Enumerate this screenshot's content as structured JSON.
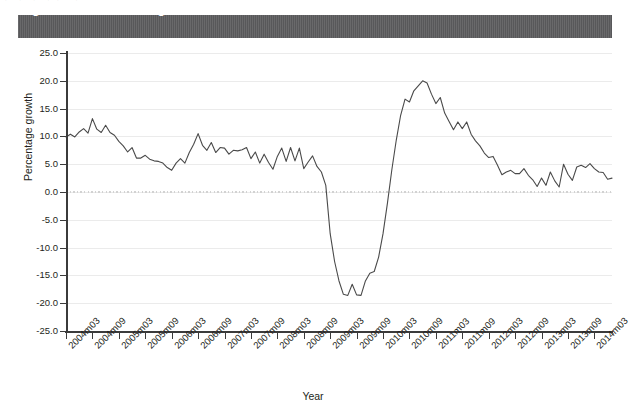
{
  "page_top_fragment": ". ,  .  .     ,    .       .  ,   .    .   ,  .   ,  .  .  .   ,   .",
  "figure": {
    "title": "Figure 2.13: World trade growth"
  },
  "chart_data": {
    "type": "line",
    "title": "Figure 2.13: World trade growth",
    "xlabel": "Year",
    "ylabel": "Percentage growth",
    "ylim": [
      -25.0,
      25.0
    ],
    "y_ticks": [
      "25.0",
      "20.0",
      "15.0",
      "10.0",
      "5.0",
      "0.0",
      "-5.0",
      "-10.0",
      "-15.0",
      "-20.0",
      "-25.0"
    ],
    "y_tick_values": [
      25.0,
      20.0,
      15.0,
      10.0,
      5.0,
      0.0,
      -5.0,
      -10.0,
      -15.0,
      -20.0,
      -25.0
    ],
    "grid": "horizontal",
    "legend": "none",
    "zero_reference_line": true,
    "x_tick_labels": [
      "2004m03",
      "2004m09",
      "2005m03",
      "2005m09",
      "2006m03",
      "2006m09",
      "2007m03",
      "2007m09",
      "2008m03",
      "2008m09",
      "2009m03",
      "2009m09",
      "2010m03",
      "2010m09",
      "2011m03",
      "2011m09",
      "2012m03",
      "2012m09",
      "2013m03",
      "2013m09",
      "2014m03"
    ],
    "x_tick_count": 21,
    "x_start": "2004m03",
    "x_end": "2014m03",
    "x_interval_months": 6,
    "series_name": "World trade growth",
    "series_color": "#4a4a4a",
    "x_months": [
      "2004m03",
      "2004m04",
      "2004m05",
      "2004m06",
      "2004m07",
      "2004m08",
      "2004m09",
      "2004m10",
      "2004m11",
      "2004m12",
      "2005m01",
      "2005m02",
      "2005m03",
      "2005m04",
      "2005m05",
      "2005m06",
      "2005m07",
      "2005m08",
      "2005m09",
      "2005m10",
      "2005m11",
      "2005m12",
      "2006m01",
      "2006m02",
      "2006m03",
      "2006m04",
      "2006m05",
      "2006m06",
      "2006m07",
      "2006m08",
      "2006m09",
      "2006m10",
      "2006m11",
      "2006m12",
      "2007m01",
      "2007m02",
      "2007m03",
      "2007m04",
      "2007m05",
      "2007m06",
      "2007m07",
      "2007m08",
      "2007m09",
      "2007m10",
      "2007m11",
      "2007m12",
      "2008m01",
      "2008m02",
      "2008m03",
      "2008m04",
      "2008m05",
      "2008m06",
      "2008m07",
      "2008m08",
      "2008m09",
      "2008m10",
      "2008m11",
      "2008m12",
      "2009m01",
      "2009m02",
      "2009m03",
      "2009m04",
      "2009m05",
      "2009m06",
      "2009m07",
      "2009m08",
      "2009m09",
      "2009m10",
      "2009m11",
      "2009m12",
      "2010m01",
      "2010m02",
      "2010m03",
      "2010m04",
      "2010m05",
      "2010m06",
      "2010m07",
      "2010m08",
      "2010m09",
      "2010m10",
      "2010m11",
      "2010m12",
      "2011m01",
      "2011m02",
      "2011m03",
      "2011m04",
      "2011m05",
      "2011m06",
      "2011m07",
      "2011m08",
      "2011m09",
      "2011m10",
      "2011m11",
      "2011m12",
      "2012m01",
      "2012m02",
      "2012m03",
      "2012m04",
      "2012m05",
      "2012m06",
      "2012m07",
      "2012m08",
      "2012m09",
      "2012m10",
      "2012m11",
      "2012m12",
      "2013m01",
      "2013m02",
      "2013m03",
      "2013m04",
      "2013m05",
      "2013m06",
      "2013m07",
      "2013m08",
      "2013m09",
      "2013m10",
      "2013m11",
      "2013m12",
      "2014m01",
      "2014m02",
      "2014m03"
    ],
    "values": [
      9.9,
      10.4,
      9.9,
      10.8,
      11.4,
      10.6,
      13.2,
      11.3,
      10.7,
      12.0,
      10.7,
      10.2,
      9.1,
      8.3,
      7.2,
      8.0,
      6.1,
      6.1,
      6.6,
      5.9,
      5.6,
      5.5,
      5.2,
      4.4,
      3.9,
      5.2,
      6.0,
      5.2,
      7.1,
      8.6,
      10.5,
      8.4,
      7.5,
      8.9,
      7.1,
      8.0,
      7.9,
      6.8,
      7.5,
      7.4,
      7.6,
      8.0,
      6.0,
      7.2,
      5.2,
      6.8,
      5.3,
      4.1,
      6.4,
      7.9,
      5.5,
      8.0,
      5.6,
      7.9,
      4.2,
      5.4,
      6.5,
      4.6,
      3.6,
      1.2,
      -7.5,
      -12.5,
      -16.0,
      -18.4,
      -18.6,
      -16.6,
      -18.5,
      -18.6,
      -16.0,
      -14.6,
      -14.3,
      -11.7,
      -7.5,
      -2.0,
      4.0,
      9.3,
      13.8,
      16.7,
      16.2,
      18.2,
      19.1,
      20.0,
      19.6,
      17.6,
      15.9,
      17.0,
      14.2,
      12.7,
      11.2,
      12.6,
      11.4,
      12.6,
      10.4,
      9.2,
      8.3,
      7.0,
      6.2,
      6.4,
      4.8,
      3.1,
      3.6,
      3.9,
      3.3,
      3.3,
      4.2,
      3.0,
      2.2,
      1.0,
      2.5,
      1.2,
      3.6,
      2.0,
      0.9,
      5.0,
      3.2,
      2.1,
      4.5,
      4.8,
      4.4,
      5.1,
      4.2,
      3.6,
      3.5,
      2.3,
      2.5
    ]
  }
}
